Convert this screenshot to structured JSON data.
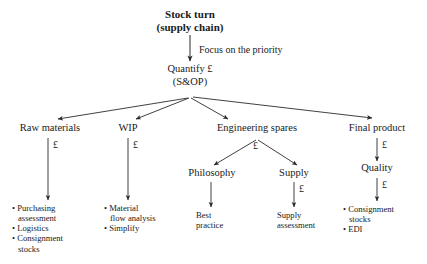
{
  "diagram": {
    "title_line1": "Stock turn",
    "title_line2": "(supply chain)",
    "edge_note": "Focus on the priority",
    "quantify_line1": "Quantify £",
    "quantify_line2": "(S&OP)",
    "currency": "£",
    "branches": {
      "raw_materials": {
        "label": "Raw materials",
        "cost_label": "£",
        "bullets": [
          {
            "line1": "• Purchasing",
            "line2": "assessment"
          },
          {
            "line1": "• Logistics",
            "line2": ""
          },
          {
            "line1": "• Consignment",
            "line2": "stocks"
          }
        ]
      },
      "wip": {
        "label": "WIP",
        "cost_label": "£",
        "bullets": [
          {
            "line1": "• Material",
            "line2": "flow analysis"
          },
          {
            "line1": "• Simplify",
            "line2": ""
          }
        ]
      },
      "engineering_spares": {
        "label": "Engineering spares",
        "cost_label": "£",
        "children": {
          "philosophy": {
            "label": "Philosophy",
            "cost_label": "",
            "outcome_line1": "Best",
            "outcome_line2": "practice"
          },
          "supply": {
            "label": "Supply",
            "cost_label": "£",
            "outcome_line1": "Supply",
            "outcome_line2": "assessment"
          }
        }
      },
      "final_product": {
        "label": "Final product",
        "cost_label": "£",
        "quality_label": "Quality",
        "quality_cost_label": "£",
        "bullets": [
          {
            "line1": "• Consignment",
            "line2": "stocks"
          },
          {
            "line1": "• EDI",
            "line2": ""
          }
        ]
      }
    }
  }
}
